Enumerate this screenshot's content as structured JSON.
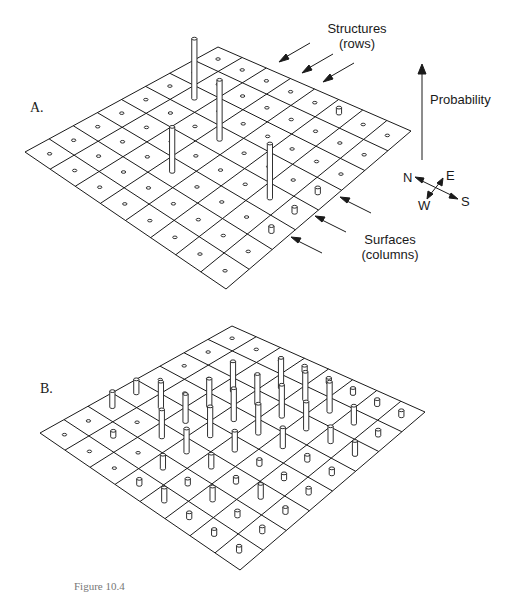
{
  "figure": {
    "caption": "Figure 10.4",
    "line_color": "#1a1a1a",
    "background": "#ffffff"
  },
  "labels": {
    "structures": "Structures",
    "structures_sub": "(rows)",
    "probability": "Probability",
    "surfaces": "Surfaces",
    "surfaces_sub": "(columns)",
    "compass": {
      "n": "N",
      "e": "E",
      "w": "W",
      "s": "S"
    }
  },
  "panels": [
    {
      "id": "A",
      "label": "A.",
      "corners": {
        "top": [
          218,
          47
        ],
        "right": [
          411,
          131
        ],
        "bottom": [
          226,
          289
        ],
        "left": [
          25,
          152
        ]
      },
      "grid_size": 8,
      "heights": [
        [
          0,
          0,
          0,
          0,
          0,
          6,
          0,
          0
        ],
        [
          0,
          0,
          0,
          0,
          0,
          0,
          0,
          0
        ],
        [
          0,
          60,
          0,
          0,
          0,
          0,
          0,
          0
        ],
        [
          0,
          0,
          0,
          60,
          0,
          0,
          0,
          6
        ],
        [
          0,
          0,
          0,
          0,
          0,
          0,
          55,
          6
        ],
        [
          0,
          0,
          0,
          45,
          0,
          0,
          0,
          6
        ],
        [
          0,
          0,
          0,
          0,
          0,
          0,
          0,
          0
        ],
        [
          0,
          0,
          0,
          0,
          0,
          0,
          0,
          0
        ]
      ]
    },
    {
      "id": "B",
      "label": "B.",
      "corners": {
        "top": [
          232,
          326
        ],
        "right": [
          425,
          412
        ],
        "bottom": [
          240,
          570
        ],
        "left": [
          40,
          433
        ]
      },
      "grid_size": 8,
      "heights": [
        [
          0,
          0,
          0,
          6,
          5,
          6,
          6,
          6
        ],
        [
          0,
          0,
          0,
          30,
          28,
          30,
          18,
          6
        ],
        [
          0,
          0,
          30,
          30,
          32,
          28,
          16,
          14
        ],
        [
          0,
          0,
          28,
          32,
          30,
          20,
          6,
          6
        ],
        [
          14,
          26,
          28,
          30,
          20,
          6,
          6,
          6
        ],
        [
          16,
          0,
          28,
          24,
          14,
          6,
          14,
          6
        ],
        [
          0,
          6,
          0,
          14,
          6,
          14,
          6,
          6
        ],
        [
          0,
          0,
          0,
          6,
          14,
          6,
          6,
          6
        ]
      ]
    }
  ]
}
